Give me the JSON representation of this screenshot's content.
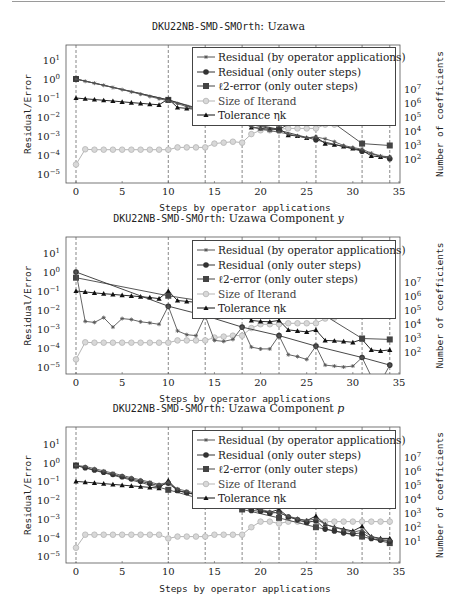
{
  "page": {
    "top_rule": true
  },
  "chart_data": [
    {
      "type": "line",
      "title_prefix": "DKU22NB-SMD-SMOrth",
      "title_suffix": ": Uzawa",
      "title_math": "",
      "xlabel": "Steps by operator applications",
      "ylabel": "Residual/Error",
      "y2label": "Number of coefficients",
      "xlim": [
        0,
        35
      ],
      "ylim_log10": [
        -5.5,
        1.6
      ],
      "xticks": [
        0,
        5,
        10,
        15,
        20,
        25,
        30,
        35
      ],
      "yticks": [
        "10^1",
        "10^0",
        "10^-1",
        "10^-2",
        "10^-3",
        "10^-4",
        "10^-5"
      ],
      "y2ticks": [
        "10^7",
        "10^6",
        "10^5",
        "10^4",
        "10^3",
        "10^2"
      ],
      "vlines": [
        0,
        10,
        14,
        18,
        22,
        26,
        31,
        34
      ],
      "legend": [
        "Residual (by operator applications)",
        "Residual (only outer steps)",
        "ℓ2-error (only outer steps)",
        "Size of Iterand",
        "Tolerance ηk"
      ],
      "series": [
        {
          "name": "Residual (by operator applications)",
          "x": [
            0,
            1,
            2,
            3,
            4,
            5,
            6,
            7,
            8,
            9,
            10,
            11,
            12,
            13,
            14,
            15,
            16,
            17,
            18,
            19,
            20,
            21,
            22,
            23,
            24,
            25,
            26,
            27,
            28,
            29,
            30,
            31,
            32,
            33,
            34
          ],
          "log10": [
            0,
            -0.12,
            -0.22,
            -0.33,
            -0.45,
            -0.56,
            -0.68,
            -0.8,
            -0.92,
            -1.04,
            -1.15,
            -1.3,
            -1.45,
            -1.6,
            -1.75,
            -1.9,
            -2.05,
            -2.2,
            -2.35,
            -2.5,
            -2.62,
            -2.72,
            -2.8,
            -2.9,
            -3.0,
            -3.1,
            -3.05,
            -3.15,
            -3.3,
            -3.5,
            -3.6,
            -3.7,
            -3.9,
            -4.05,
            -4.1
          ]
        },
        {
          "name": "Residual (only outer steps)",
          "x": [
            0,
            10,
            14,
            18,
            22,
            26,
            31,
            34
          ],
          "log10": [
            0,
            -1.1,
            -1.7,
            -2.3,
            -2.7,
            -3.2,
            -3.8,
            -4.2
          ]
        },
        {
          "name": "ℓ2-error (only outer steps)",
          "x": [
            0,
            10,
            14,
            18,
            22,
            26,
            31,
            34
          ],
          "log10": [
            0,
            -1.1,
            -1.65,
            -2.25,
            -2.65,
            -1.65,
            -3.4,
            -3.5
          ]
        },
        {
          "name": "Size of Iterand",
          "x": [
            0,
            1,
            2,
            3,
            4,
            5,
            6,
            7,
            8,
            9,
            10,
            11,
            12,
            13,
            14,
            15,
            16,
            17,
            18,
            19,
            20,
            21,
            22,
            23,
            24,
            25,
            26,
            27,
            28
          ],
          "log10": [
            -4.5,
            -3.7,
            -3.72,
            -3.72,
            -3.72,
            -3.72,
            -3.72,
            -3.72,
            -3.72,
            -3.72,
            -3.72,
            -3.6,
            -3.6,
            -3.6,
            -3.6,
            -3.4,
            -3.35,
            -3.3,
            -3.35,
            -2.9,
            -2.7,
            -2.7,
            -2.65,
            -2.6,
            -2.6,
            -2.6,
            -2.6,
            -2.4,
            -2.4
          ]
        },
        {
          "name": "Tolerance ηk",
          "x": [
            0,
            1,
            2,
            3,
            4,
            5,
            6,
            7,
            8,
            9,
            10,
            11,
            12,
            13,
            14,
            15,
            16,
            17,
            18,
            19,
            20,
            21,
            22,
            23,
            24,
            25,
            26,
            27,
            28,
            29,
            30,
            31,
            32,
            33,
            34
          ],
          "log10": [
            -1,
            -1.04,
            -1.08,
            -1.12,
            -1.16,
            -1.2,
            -1.24,
            -1.28,
            -1.32,
            -1.36,
            -1.05,
            -1.5,
            -1.55,
            -1.6,
            -1.65,
            -1.8,
            -1.9,
            -2.0,
            -2.1,
            -2.55,
            -2.6,
            -2.65,
            -2.6,
            -2.95,
            -3.0,
            -3.1,
            -3.05,
            -3.4,
            -3.45,
            -3.55,
            -3.65,
            -3.75,
            -4.05,
            -4.1,
            -4.1
          ]
        }
      ]
    },
    {
      "type": "line",
      "title_prefix": "DKU22NB-SMD-SMOrth",
      "title_suffix": ": Uzawa Component ",
      "title_math": "y",
      "xlabel": "Steps by operator applications",
      "ylabel": "Residual/Error",
      "y2label": "Number of coefficients",
      "xlim": [
        0,
        35
      ],
      "ylim_log10": [
        -5.5,
        1.6
      ],
      "xticks": [
        0,
        5,
        10,
        15,
        20,
        25,
        30,
        35
      ],
      "yticks": [
        "10^1",
        "10^0",
        "10^-1",
        "10^-2",
        "10^-3",
        "10^-4",
        "10^-5"
      ],
      "y2ticks": [
        "10^7",
        "10^6",
        "10^5",
        "10^4",
        "10^3",
        "10^2"
      ],
      "vlines": [
        0,
        10,
        14,
        18,
        22,
        26,
        31,
        34
      ],
      "legend": [
        "Residual (by operator applications)",
        "Residual (only outer steps)",
        "ℓ2-error (only outer steps)",
        "Size of Iterand",
        "Tolerance ηk"
      ],
      "series": [
        {
          "name": "Residual (by operator applications)",
          "x": [
            0,
            1,
            2,
            3,
            4,
            5,
            6,
            7,
            8,
            9,
            10,
            11,
            12,
            13,
            14,
            15,
            16,
            17,
            18,
            19,
            20,
            21,
            22,
            23,
            24,
            25,
            26,
            27,
            28,
            29,
            30,
            31,
            32,
            33,
            34
          ],
          "log10": [
            0,
            -2.6,
            -2.65,
            -2.4,
            -2.9,
            -2.45,
            -2.5,
            -2.62,
            -2.68,
            -2.75,
            -1.8,
            -3.1,
            -3.3,
            -3.35,
            -2.3,
            -3.6,
            -3.65,
            -3.55,
            -2.9,
            -3.95,
            -4.05,
            -4.05,
            -3.35,
            -4.35,
            -4.45,
            -4.6,
            -3.9,
            -4.9,
            -4.95,
            -5.0,
            -4.95,
            -4.5,
            -5.5,
            -5.8,
            -4.9
          ]
        },
        {
          "name": "Residual (only outer steps)",
          "x": [
            0,
            10,
            14,
            18,
            22,
            26,
            31,
            34
          ],
          "log10": [
            0,
            -1.8,
            -2.3,
            -2.9,
            -3.35,
            -3.9,
            -4.5,
            -4.9
          ]
        },
        {
          "name": "ℓ2-error (only outer steps)",
          "x": [
            0,
            10,
            14,
            18,
            22,
            26,
            31,
            34
          ],
          "log10": [
            -0.3,
            -1.25,
            -1.55,
            -1.8,
            -1.95,
            -2.0,
            -3.5,
            -3.55
          ]
        },
        {
          "name": "Size of Iterand",
          "x": [
            0,
            1,
            2,
            3,
            4,
            5,
            6,
            7,
            8,
            9,
            10,
            11,
            12,
            13,
            14,
            15,
            16,
            17,
            18,
            19,
            20,
            21,
            22,
            23,
            24,
            25,
            26,
            27,
            28
          ],
          "log10": [
            -4.6,
            -3.7,
            -3.72,
            -3.72,
            -3.72,
            -3.72,
            -3.72,
            -3.72,
            -3.72,
            -3.72,
            -3.72,
            -3.6,
            -3.6,
            -3.6,
            -3.6,
            -3.45,
            -3.4,
            -3.35,
            -3.35,
            -2.95,
            -2.75,
            -2.75,
            -2.75,
            -2.7,
            -2.7,
            -2.7,
            -2.7,
            -2.45,
            -2.4
          ]
        },
        {
          "name": "Tolerance ηk",
          "x": [
            0,
            1,
            2,
            3,
            4,
            5,
            6,
            7,
            8,
            9,
            10,
            11,
            12,
            13,
            14,
            15,
            16,
            17,
            18,
            19,
            20,
            21,
            22,
            23,
            24,
            25,
            26,
            27,
            28,
            29,
            30,
            31,
            32,
            33,
            34
          ],
          "log10": [
            -1,
            -1.05,
            -1.1,
            -1.14,
            -1.18,
            -1.22,
            -1.26,
            -1.3,
            -1.34,
            -1.4,
            -1.0,
            -1.5,
            -1.55,
            -1.6,
            -1.65,
            -1.8,
            -1.9,
            -2.0,
            -2.1,
            -2.55,
            -2.6,
            -2.62,
            -2.55,
            -3.05,
            -3.1,
            -3.15,
            -3.05,
            -3.6,
            -3.62,
            -3.65,
            -3.7,
            -3.55,
            -4.1,
            -4.15,
            -4.1
          ]
        }
      ]
    },
    {
      "type": "line",
      "title_prefix": "DKU22NB-SMD-SMOrth",
      "title_suffix": ": Uzawa Component ",
      "title_math": "p",
      "xlabel": "Steps by operator applications",
      "ylabel": "Residual/Error",
      "y2label": "Number of coefficients",
      "xlim": [
        0,
        35
      ],
      "ylim_log10": [
        -5.5,
        1.6
      ],
      "xticks": [
        0,
        5,
        10,
        15,
        20,
        25,
        30,
        35
      ],
      "yticks": [
        "10^1",
        "10^0",
        "10^-1",
        "10^-2",
        "10^-3",
        "10^-4",
        "10^-5"
      ],
      "y2ticks": [
        "10^7",
        "10^6",
        "10^5",
        "10^4",
        "10^3",
        "10^2",
        "10^1"
      ],
      "vlines": [
        0,
        10,
        14,
        18,
        22,
        26,
        31,
        34
      ],
      "legend": [
        "Residual (by operator applications)",
        "Residual (only outer steps)",
        "ℓ2-error (only outer steps)",
        "Size of Iterand",
        "Tolerance ηk"
      ],
      "series": [
        {
          "name": "Residual (by operator applications)",
          "x": [
            0,
            1,
            2,
            3,
            4,
            5,
            6,
            7,
            8,
            9,
            10,
            11,
            12,
            13,
            14,
            15,
            16,
            17,
            18,
            19,
            20,
            21,
            22,
            23,
            24,
            25,
            26,
            27,
            28,
            29,
            30,
            31,
            32,
            33,
            34
          ],
          "log10": [
            -0.15,
            -0.2,
            -0.32,
            -0.44,
            -0.56,
            -0.68,
            -0.8,
            -0.92,
            -1.04,
            -1.16,
            -1.05,
            -1.4,
            -1.52,
            -1.64,
            -1.76,
            -1.88,
            -2.0,
            -2.12,
            -2.24,
            -2.36,
            -2.5,
            -2.62,
            -2.7,
            -2.85,
            -3.0,
            -3.1,
            -3.0,
            -3.3,
            -3.45,
            -3.6,
            -3.72,
            -3.6,
            -3.95,
            -4.1,
            -4.15
          ]
        },
        {
          "name": "Residual (only outer steps)",
          "x": [
            0,
            1,
            2,
            3,
            4,
            5,
            6,
            7,
            8,
            9,
            10,
            11,
            12,
            13,
            14,
            15,
            16,
            17,
            18,
            19,
            20,
            21,
            22,
            23,
            24,
            25,
            26,
            27,
            28,
            29,
            30,
            31,
            32,
            33,
            34
          ],
          "log10": [
            -0.15,
            -0.27,
            -0.39,
            -0.51,
            -0.63,
            -0.75,
            -0.87,
            -0.99,
            -1.11,
            -1.23,
            -1.1,
            -1.48,
            -1.6,
            -1.72,
            -1.84,
            -1.96,
            -2.08,
            -2.2,
            -2.32,
            -2.55,
            -2.6,
            -2.7,
            -2.65,
            -2.9,
            -3.05,
            -3.2,
            -3.1,
            -3.55,
            -3.65,
            -3.75,
            -3.8,
            -3.75,
            -4.05,
            -4.15,
            -4.2
          ]
        },
        {
          "name": "ℓ2-error (only outer steps)",
          "x": [
            0,
            10,
            14,
            18,
            22,
            26,
            31,
            34
          ],
          "log10": [
            -0.15,
            -1.45,
            -2.0,
            -2.5,
            -2.95,
            -3.45,
            -3.95,
            -4.3
          ]
        },
        {
          "name": "Size of Iterand",
          "x": [
            0,
            1,
            2,
            3,
            4,
            5,
            6,
            7,
            8,
            9,
            10,
            11,
            12,
            13,
            14,
            15,
            16,
            17,
            18,
            19,
            20,
            21,
            22,
            23,
            24,
            25,
            26,
            27,
            28,
            29,
            30,
            31,
            32,
            33,
            34
          ],
          "log10": [
            -4.55,
            -3.85,
            -3.85,
            -3.85,
            -3.85,
            -3.85,
            -3.85,
            -3.85,
            -3.85,
            -3.85,
            -4.05,
            -3.95,
            -3.95,
            -3.95,
            -3.95,
            -3.85,
            -3.85,
            -3.85,
            -3.85,
            -3.45,
            -3.15,
            -3.15,
            -3.25,
            -3.15,
            -3.15,
            -3.15,
            -3.15,
            -3.15,
            -3.15,
            -3.15,
            -3.15,
            -3.15,
            -3.15,
            -3.15,
            -3.15
          ]
        },
        {
          "name": "Tolerance ηk",
          "x": [
            0,
            1,
            2,
            3,
            4,
            5,
            6,
            7,
            8,
            9,
            10,
            11,
            12,
            13,
            14,
            15,
            16,
            17,
            18,
            19,
            20,
            21,
            22,
            23,
            24,
            25,
            26,
            27,
            28,
            29,
            30,
            31,
            32,
            33,
            34
          ],
          "log10": [
            -1,
            -1.04,
            -1.08,
            -1.12,
            -1.16,
            -1.2,
            -1.24,
            -1.28,
            -1.32,
            -1.36,
            -0.95,
            -1.5,
            -1.6,
            -1.7,
            -1.8,
            -1.9,
            -2.0,
            -2.1,
            -2.2,
            -2.4,
            -2.55,
            -2.65,
            -2.5,
            -2.9,
            -3.0,
            -3.1,
            -2.85,
            -3.3,
            -3.45,
            -3.55,
            -3.65,
            -3.4,
            -3.95,
            -4.05,
            -4.05
          ]
        }
      ]
    }
  ],
  "styles": {
    "colors": {
      "residual_ops": "#555555",
      "residual_outer": "#333333",
      "l2": "#444444",
      "size": "#b5b5b5",
      "tolerance": "#111111",
      "vline": "#555555",
      "frame": "#555555"
    }
  }
}
